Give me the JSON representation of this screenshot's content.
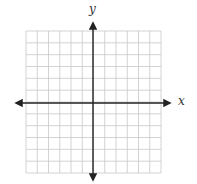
{
  "chart_data": {
    "type": "scatter",
    "title": "",
    "xlabel": "x",
    "ylabel": "y",
    "xlim": [
      -6,
      6
    ],
    "ylim": [
      -6,
      6
    ],
    "grid": true,
    "grid_step": 1,
    "grid_columns": 12,
    "grid_rows": 12,
    "axes_arrows": true,
    "tick_labels": [],
    "series": [],
    "legend": null
  },
  "colors": {
    "grid": "#c8c8c8",
    "axis": "#222222",
    "label": "#333333",
    "background": "#ffffff"
  }
}
